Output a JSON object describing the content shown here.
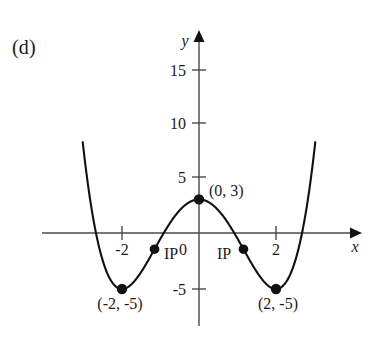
{
  "figure": {
    "part_label": "(d)",
    "axes": {
      "x_axis_name": "x",
      "y_axis_name": "y",
      "x_ticks": [
        "-2",
        "2"
      ],
      "y_ticks": [
        "-5",
        "5",
        "10",
        "15"
      ],
      "origin_label": "0"
    },
    "annotations": {
      "max_point_label": "(0, 3)",
      "left_min_label": "(-2, -5)",
      "right_min_label": "(2, -5)",
      "inflection_left_label": "IP",
      "inflection_right_label": "IP"
    },
    "colors": {
      "curve": "#111111",
      "axis": "#4a4a4a",
      "point": "#111111",
      "background": "#ffffff"
    }
  },
  "chart_data": {
    "type": "line",
    "title": "",
    "subtitle": "",
    "xlabel": "x",
    "ylabel": "y",
    "xlim": [
      -3.2,
      3.2
    ],
    "ylim": [
      -7,
      17
    ],
    "grid": false,
    "legend": null,
    "function": "y = 0.5x^4 - 4x^2 + 3",
    "xticks": [
      -2,
      2
    ],
    "xtick_labels": [
      "-2",
      "2"
    ],
    "yticks": [
      -5,
      5,
      10,
      15
    ],
    "ytick_labels": [
      "-5",
      "5",
      "10",
      "15"
    ],
    "series": [
      {
        "name": "f(x) = 0.5x^4 - 4x^2 + 3",
        "x": [
          -3.0,
          -2.9,
          -2.8,
          -2.7,
          -2.6,
          -2.5,
          -2.4,
          -2.3,
          -2.2,
          -2.1,
          -2.0,
          -1.9,
          -1.8,
          -1.7,
          -1.6,
          -1.5,
          -1.4,
          -1.3,
          -1.2,
          -1.1,
          -1.0,
          -0.9,
          -0.8,
          -0.7,
          -0.6,
          -0.5,
          -0.4,
          -0.3,
          -0.2,
          -0.1,
          0.0,
          0.1,
          0.2,
          0.3,
          0.4,
          0.5,
          0.6,
          0.7,
          0.8,
          0.9,
          1.0,
          1.1,
          1.2,
          1.3,
          1.4,
          1.5,
          1.6,
          1.7,
          1.8,
          1.9,
          2.0,
          2.1,
          2.2,
          2.3,
          2.4,
          2.5,
          2.6,
          2.7,
          2.8,
          2.9,
          3.0
        ],
        "y": [
          4.5,
          0.35,
          -2.41,
          -4.09,
          -4.87,
          -4.91,
          -4.38,
          -3.41,
          -2.14,
          -0.68,
          1.0,
          -4.87,
          -4.95,
          -4.38,
          -4.14,
          -4.47,
          -5.0,
          -5.33,
          -5.24,
          -4.72,
          -3.84,
          -2.72,
          -1.48,
          -0.27,
          0.78,
          1.53,
          2.38,
          2.65,
          2.84,
          2.96,
          3.0,
          2.96,
          2.84,
          2.65,
          2.38,
          1.53,
          0.78,
          -0.27,
          -1.48,
          -2.72,
          -3.84,
          -4.72,
          -5.24,
          -5.33,
          -5.0,
          -4.47,
          -4.14,
          -4.38,
          -4.95,
          -4.87,
          -5.0,
          -0.68,
          -2.14,
          -3.41,
          -4.38,
          -4.91,
          -4.87,
          -4.09,
          -2.41,
          0.35,
          4.5
        ]
      }
    ],
    "points": [
      {
        "label": "(0, 3)",
        "x": 0,
        "y": 3,
        "kind": "local-maximum"
      },
      {
        "label": "(-2, -5)",
        "x": -2,
        "y": -5,
        "kind": "local-minimum"
      },
      {
        "label": "(2, -5)",
        "x": 2,
        "y": -5,
        "kind": "local-minimum"
      },
      {
        "label": "IP",
        "x": -1.155,
        "y": -1.44,
        "kind": "inflection-point"
      },
      {
        "label": "IP",
        "x": 1.155,
        "y": -1.44,
        "kind": "inflection-point"
      }
    ]
  }
}
